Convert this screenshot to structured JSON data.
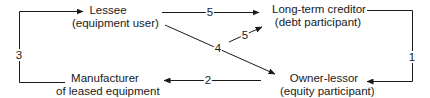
{
  "nodes": {
    "lessee": {
      "title": "Lessee",
      "subtitle": "(equipment user)"
    },
    "creditor": {
      "title": "Long-term creditor",
      "subtitle": "(debt participant)"
    },
    "manufacturer": {
      "title": "Manufacturer",
      "subtitle": "of leased equipment"
    },
    "owner_lessor": {
      "title": "Owner-lessor",
      "subtitle": "(equity participant)"
    }
  },
  "edges": [
    {
      "label": "1",
      "from": "Long-term creditor",
      "to": "Owner-lessor"
    },
    {
      "label": "2",
      "from": "Owner-lessor",
      "to": "Manufacturer"
    },
    {
      "label": "3",
      "from": "Manufacturer",
      "to": "Lessee"
    },
    {
      "label": "4",
      "from": "Lessee",
      "to": "Owner-lessor"
    },
    {
      "label": "5",
      "from": "Lessee",
      "to": "Long-term creditor"
    },
    {
      "label": "5",
      "from": "Lessee (via diagonal)",
      "to": "Long-term creditor"
    }
  ],
  "colors": {
    "line": "#1a1a1a",
    "background": "#ffffff"
  }
}
